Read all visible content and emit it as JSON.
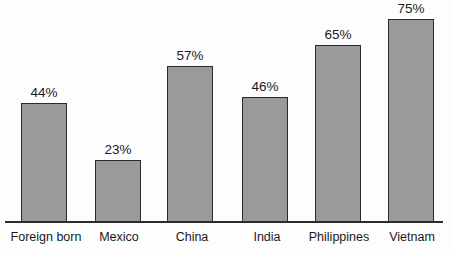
{
  "chart_data": {
    "type": "bar",
    "title": "",
    "subtitle": "",
    "xlabel": "",
    "ylabel": "",
    "grid": false,
    "legend": false,
    "legend_position": "none",
    "value_suffix": "%",
    "ylim": [
      0,
      80
    ],
    "categories": [
      "Foreign born",
      "Mexico",
      "China",
      "India",
      "Philippines",
      "Vietnam"
    ],
    "values": [
      44,
      23,
      57,
      46,
      65,
      75
    ],
    "value_labels": [
      "44%",
      "23%",
      "57%",
      "46%",
      "65%",
      "75%"
    ],
    "colors": {
      "bar_fill": "#9a9a9a",
      "bar_border": "#2b2b2b",
      "axis": "#2b2b2b",
      "background": "#fdfdfd",
      "text": "#1a1a1a"
    },
    "bar_geometry": [
      {
        "x": 21,
        "width": 46,
        "top": 103
      },
      {
        "x": 95,
        "width": 46,
        "top": 160
      },
      {
        "x": 167,
        "width": 46,
        "top": 66
      },
      {
        "x": 242,
        "width": 46,
        "top": 97
      },
      {
        "x": 315,
        "width": 46,
        "top": 45
      },
      {
        "x": 388,
        "width": 46,
        "top": 19
      }
    ],
    "label_geometry": [
      {
        "x": 0,
        "width": 92
      },
      {
        "x": 76,
        "width": 86
      },
      {
        "x": 149,
        "width": 86
      },
      {
        "x": 224,
        "width": 86
      },
      {
        "x": 291,
        "width": 96
      },
      {
        "x": 371,
        "width": 82
      }
    ]
  }
}
